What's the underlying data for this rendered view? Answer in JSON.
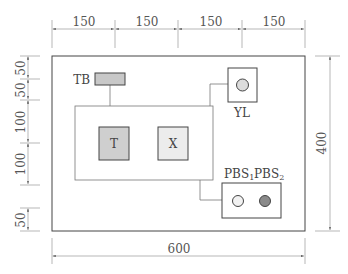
{
  "diagram": {
    "type": "panel-layout-drawing",
    "dimensions": {
      "top": [
        "150",
        "150",
        "150",
        "150"
      ],
      "bottom": "600",
      "right": "400",
      "left": [
        "50",
        "50",
        "100",
        "100",
        "50"
      ]
    },
    "components": {
      "tb": {
        "label": "TB"
      },
      "t": {
        "label": "T"
      },
      "x": {
        "label": "X"
      },
      "yl": {
        "label": "YL"
      },
      "pbs1": {
        "label": "PBS",
        "sub": "1"
      },
      "pbs2": {
        "label": "PBS",
        "sub": "2"
      }
    },
    "colors": {
      "line": "#555555",
      "tb_fill": "#c8c8c8",
      "t_fill": "#cfcfcf",
      "x_fill": "#ececec",
      "yl_lamp": "#dcdcdc",
      "pbs1_fill": "#f2f2f2",
      "pbs2_fill": "#8a8a8a"
    }
  }
}
